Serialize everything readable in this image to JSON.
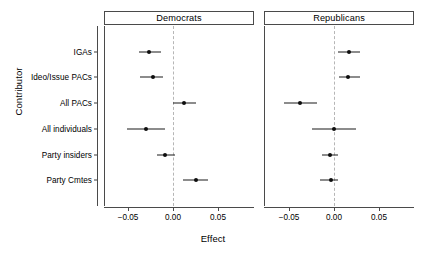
{
  "chart_data": {
    "type": "scatter",
    "title": "",
    "xlabel": "Effect",
    "ylabel": "Contributor",
    "xlim": [
      -0.073,
      0.077
    ],
    "xticks": [
      -0.05,
      0.0,
      0.05
    ],
    "xtick_labels": [
      "−0.05",
      "0.00",
      "0.05"
    ],
    "grid": false,
    "legend": null,
    "zero_reference_line": 0.0,
    "categories": [
      "IGAs",
      "Ideo/Issue PACs",
      "All PACs",
      "All individuals",
      "Party insiders",
      "Party Cmtes"
    ],
    "panels": [
      {
        "label": "Democrats",
        "points": [
          {
            "category": "IGAs",
            "estimate": -0.027,
            "low": -0.038,
            "high": -0.013
          },
          {
            "category": "Ideo/Issue PACs",
            "estimate": -0.022,
            "low": -0.037,
            "high": -0.011
          },
          {
            "category": "All PACs",
            "estimate": 0.012,
            "low": 0.0,
            "high": 0.026
          },
          {
            "category": "All individuals",
            "estimate": -0.03,
            "low": -0.051,
            "high": -0.009
          },
          {
            "category": "Party insiders",
            "estimate": -0.009,
            "low": -0.018,
            "high": 0.002
          },
          {
            "category": "Party Cmtes",
            "estimate": 0.025,
            "low": 0.011,
            "high": 0.039
          }
        ]
      },
      {
        "label": "Republicans",
        "points": [
          {
            "category": "IGAs",
            "estimate": 0.017,
            "low": 0.004,
            "high": 0.029
          },
          {
            "category": "Ideo/Issue PACs",
            "estimate": 0.016,
            "low": 0.005,
            "high": 0.029
          },
          {
            "category": "All PACs",
            "estimate": -0.038,
            "low": -0.056,
            "high": -0.019
          },
          {
            "category": "All individuals",
            "estimate": 0.0,
            "low": -0.024,
            "high": 0.025
          },
          {
            "category": "Party insiders",
            "estimate": -0.005,
            "low": -0.013,
            "high": 0.005
          },
          {
            "category": "Party Cmtes",
            "estimate": -0.003,
            "low": -0.016,
            "high": 0.005
          }
        ]
      }
    ],
    "colors": {
      "point": "#0d0d0d",
      "interval": "#1a1a1a",
      "axis": "#4a4a4a",
      "zero_line": "#b6b6b6",
      "background": "#ffffff"
    }
  }
}
